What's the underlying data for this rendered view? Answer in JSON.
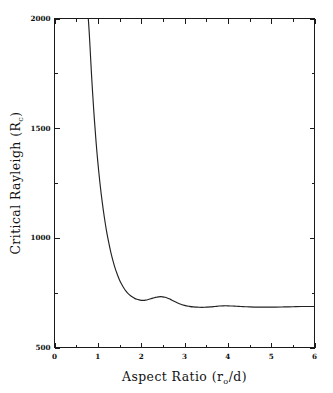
{
  "chart_data": {
    "type": "line",
    "title": "",
    "xlabel": "Aspect Ratio (rₒ/d)",
    "xlabel_main": "Aspect Ratio (r",
    "xlabel_sub": "o",
    "xlabel_tail": "/d)",
    "ylabel": "Critical Rayleigh (Rᴄ)",
    "ylabel_main": "Critical Rayleigh (R",
    "ylabel_sub": "c",
    "ylabel_tail": ")",
    "xlim": [
      0,
      6
    ],
    "ylim": [
      500,
      2000
    ],
    "grid": false,
    "legend": null,
    "xticks": [
      0,
      1,
      2,
      3,
      4,
      5,
      6
    ],
    "xticklabels": [
      "0",
      "1",
      "2",
      "3",
      "4",
      "5",
      "6"
    ],
    "xminorticks": [
      0.5,
      1.5,
      2.5,
      3.5,
      4.5,
      5.5
    ],
    "yticks": [
      500,
      1000,
      1500,
      2000
    ],
    "yticklabels": [
      "500",
      "1000",
      "1500",
      "2000"
    ],
    "yminorticks": [
      750,
      1250,
      1750
    ],
    "line_color": "#222222",
    "background_color": "#ffffff",
    "axis_color": "#1a1a1a",
    "series": [
      {
        "name": "critical Rayleigh number",
        "x": [
          0.78,
          0.8,
          0.82,
          0.85,
          0.88,
          0.92,
          0.96,
          1.0,
          1.05,
          1.1,
          1.15,
          1.2,
          1.25,
          1.3,
          1.35,
          1.4,
          1.45,
          1.5,
          1.55,
          1.6,
          1.65,
          1.7,
          1.75,
          1.8,
          1.85,
          1.9,
          1.95,
          2.0,
          2.05,
          2.1,
          2.15,
          2.2,
          2.25,
          2.3,
          2.35,
          2.4,
          2.45,
          2.5,
          2.55,
          2.6,
          2.65,
          2.7,
          2.8,
          2.9,
          3.0,
          3.1,
          3.2,
          3.3,
          3.4,
          3.5,
          3.6,
          3.7,
          3.8,
          3.9,
          4.0,
          4.1,
          4.2,
          4.3,
          4.4,
          4.5,
          4.7,
          4.9,
          5.1,
          5.3,
          5.5,
          5.7,
          5.85,
          6.0
        ],
        "y": [
          2000,
          1940,
          1870,
          1760,
          1660,
          1540,
          1436,
          1345,
          1248,
          1165,
          1094,
          1032,
          980,
          934,
          895,
          861,
          833,
          808,
          788,
          771,
          757,
          746,
          737,
          730,
          724,
          720,
          717,
          715,
          715,
          716,
          718,
          721,
          724,
          727,
          729,
          731,
          732,
          731,
          729,
          726,
          722,
          717,
          707,
          698,
          692,
          688,
          685,
          684,
          683,
          684,
          685,
          687,
          689,
          690,
          690,
          689,
          688,
          687,
          686,
          685,
          684,
          684,
          684,
          685,
          686,
          687,
          687,
          687
        ],
        "color": "#222222"
      }
    ],
    "annotations": {
      "entry_point": "curve exits top of frame near aspect ratio 0.78",
      "primary_minimum": {
        "x": 2.0,
        "y": 715
      },
      "local_maximum": {
        "x": 2.45,
        "y": 732
      },
      "secondary_minimum": {
        "x": 3.4,
        "y": 683
      },
      "secondary_maximum": {
        "x": 3.95,
        "y": 690
      },
      "asymptote": 687
    }
  }
}
